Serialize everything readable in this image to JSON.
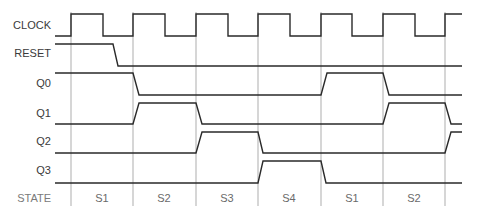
{
  "diagram": {
    "type": "timing-diagram",
    "colors": {
      "wave": "#2a2a2a",
      "grid": "#8a8a8a",
      "label": "#3a3a3a",
      "state_label": "#7a7a7a"
    },
    "signals": [
      {
        "name": "CLOCK"
      },
      {
        "name": "RESET"
      },
      {
        "name": "Q0"
      },
      {
        "name": "Q1"
      },
      {
        "name": "Q2"
      },
      {
        "name": "Q3"
      }
    ],
    "state_row": {
      "header": "STATE",
      "states": [
        "S1",
        "S2",
        "S3",
        "S4",
        "S1",
        "S2"
      ]
    },
    "waveforms": {
      "CLOCK": "low→high at each clock edge, 50% duty",
      "RESET": "high until mid S1, then low",
      "Q0": "high in S1, low S2–S4, high in S1, low in S2",
      "Q1": "low in S1, high in S2, low S3–S4, low in S1, high in S2",
      "Q2": "low S1–S2, high in S3, low S4–S2, rising at end",
      "Q3": "low S1–S3, high in S4, low S1–S2"
    }
  }
}
